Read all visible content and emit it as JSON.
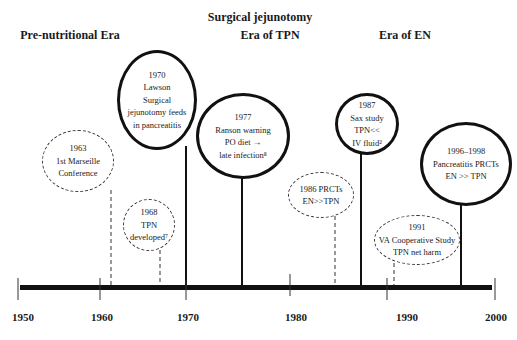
{
  "eras": [
    {
      "label": "Pre-nutritional Era",
      "x": 70,
      "y": 34
    },
    {
      "label": "Surgical jejunotomy",
      "x": 260,
      "y": 16
    },
    {
      "label": "Era of TPN",
      "x": 270,
      "y": 34
    },
    {
      "label": "Era of EN",
      "x": 405,
      "y": 34
    }
  ],
  "events": [
    {
      "id": "e1963",
      "lines": [
        "1963",
        "1st Marseille",
        "Conference"
      ],
      "style": "dashed",
      "x": 42,
      "y": 130,
      "w": 72,
      "h": 62,
      "stem_x": 111,
      "stem_top": 190
    },
    {
      "id": "e1968",
      "lines": [
        "1968",
        "TPN",
        "developed⁷"
      ],
      "style": "dashed",
      "x": 123,
      "y": 199,
      "w": 52,
      "h": 52,
      "stem_x": 160,
      "stem_top": 250
    },
    {
      "id": "e1970",
      "lines": [
        "1970",
        "Lawson",
        "Surgical",
        "jejunotomy feeds",
        "in pancreatitis"
      ],
      "style": "solid",
      "x": 117,
      "y": 50,
      "w": 80,
      "h": 100,
      "stem_x": 186,
      "stem_top": 146
    },
    {
      "id": "e1977",
      "lines": [
        "1977",
        "Ranson warning",
        "PO diet  →",
        "late infection⁸"
      ],
      "style": "solid",
      "x": 196,
      "y": 93,
      "w": 94,
      "h": 86,
      "stem_x": 242,
      "stem_top": 178
    },
    {
      "id": "e1986",
      "lines": [
        "1986 PRCTs",
        "EN>>TPN"
      ],
      "style": "dashed",
      "x": 288,
      "y": 172,
      "w": 66,
      "h": 46,
      "stem_x": 335,
      "stem_top": 216
    },
    {
      "id": "e1987",
      "lines": [
        "1987",
        "Sax study",
        "TPN<<",
        "IV fluid²"
      ],
      "style": "solid",
      "x": 335,
      "y": 93,
      "w": 64,
      "h": 62,
      "stem_x": 361,
      "stem_top": 154
    },
    {
      "id": "e1991",
      "lines": [
        "1991",
        "VA Cooperative Study",
        "TPN net harm"
      ],
      "style": "dashed",
      "x": 374,
      "y": 215,
      "w": 86,
      "h": 50,
      "stem_x": 394,
      "stem_top": 263
    },
    {
      "id": "e1996",
      "lines": [
        "1996–1998",
        "Pancreatitis PRCTs",
        "EN >> TPN"
      ],
      "style": "solid",
      "x": 420,
      "y": 122,
      "w": 92,
      "h": 84,
      "stem_x": 461,
      "stem_top": 204
    }
  ],
  "axis": {
    "ticks": [
      {
        "label": "1950",
        "x": 18
      },
      {
        "label": "1960",
        "x": 100
      },
      {
        "label": "1970",
        "x": 186
      },
      {
        "label": "1980",
        "x": 290
      },
      {
        "label": "1990",
        "x": 387
      },
      {
        "label": "2000",
        "x": 495
      }
    ],
    "bar_y": 288,
    "bar_start": 20,
    "bar_end": 492
  },
  "colors": {
    "line": "#111111",
    "dashed": "#333333",
    "background": "#ffffff"
  }
}
